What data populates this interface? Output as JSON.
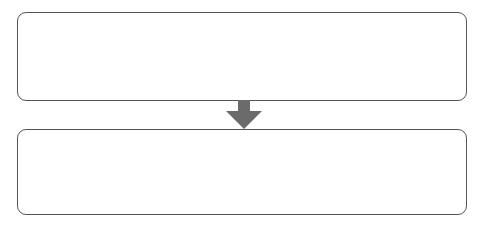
{
  "diagram": {
    "type": "flow",
    "boxes": [
      {
        "id": "top",
        "label": ""
      },
      {
        "id": "bottom",
        "label": ""
      }
    ],
    "connector": {
      "direction": "down",
      "color": "#6b6b6b"
    },
    "colors": {
      "border": "#555555",
      "background": "#ffffff"
    }
  }
}
